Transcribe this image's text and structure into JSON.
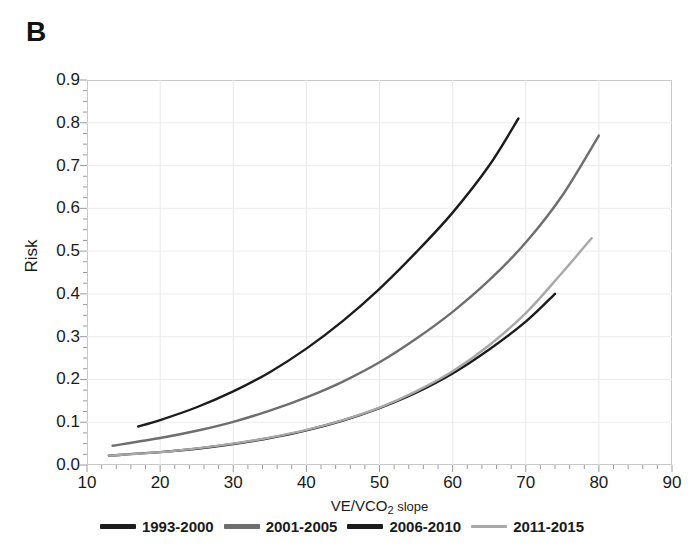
{
  "panel": {
    "label": "B"
  },
  "axes": {
    "y_label": "Risk",
    "x_label_prefix": "VE/VCO",
    "x_label_sub": "2",
    "x_label_suffix": " slope",
    "y_ticks": [
      "0.0",
      "0.1",
      "0.2",
      "0.3",
      "0.4",
      "0.5",
      "0.6",
      "0.7",
      "0.8",
      "0.9"
    ],
    "x_ticks": [
      "10",
      "20",
      "30",
      "40",
      "50",
      "60",
      "70",
      "80",
      "90"
    ]
  },
  "legend": {
    "items": [
      {
        "label": "1993-2000",
        "color": "#1c1c1c"
      },
      {
        "label": "2001-2005",
        "color": "#6e6e6e"
      },
      {
        "label": "2006-2010",
        "color": "#1c1c1c"
      },
      {
        "label": "2011-2015",
        "color": "#a8a8a8"
      }
    ]
  },
  "chart_data": {
    "type": "line",
    "title": "B",
    "xlabel": "VE/VCO2 slope",
    "ylabel": "Risk",
    "xlim": [
      10,
      90
    ],
    "ylim": [
      0.0,
      0.9
    ],
    "grid": true,
    "legend_position": "bottom",
    "series": [
      {
        "name": "1993-2000",
        "color": "#1c1c1c",
        "x": [
          17,
          20,
          25,
          30,
          35,
          40,
          45,
          50,
          55,
          60,
          65,
          69
        ],
        "y": [
          0.09,
          0.105,
          0.135,
          0.172,
          0.217,
          0.272,
          0.337,
          0.412,
          0.497,
          0.59,
          0.7,
          0.81
        ]
      },
      {
        "name": "2001-2005",
        "color": "#6e6e6e",
        "x": [
          13.5,
          20,
          25,
          30,
          35,
          40,
          45,
          50,
          55,
          60,
          65,
          70,
          75,
          80
        ],
        "y": [
          0.045,
          0.063,
          0.08,
          0.101,
          0.127,
          0.158,
          0.195,
          0.24,
          0.295,
          0.358,
          0.432,
          0.52,
          0.63,
          0.77
        ]
      },
      {
        "name": "2006-2010",
        "color": "#1c1c1c",
        "x": [
          13,
          20,
          25,
          30,
          35,
          40,
          45,
          50,
          55,
          60,
          65,
          70,
          74
        ],
        "y": [
          0.022,
          0.03,
          0.038,
          0.049,
          0.063,
          0.081,
          0.104,
          0.133,
          0.169,
          0.214,
          0.27,
          0.335,
          0.4
        ]
      },
      {
        "name": "2011-2015",
        "color": "#a8a8a8",
        "x": [
          13,
          20,
          25,
          30,
          35,
          40,
          45,
          50,
          55,
          60,
          65,
          70,
          75,
          79
        ],
        "y": [
          0.022,
          0.03,
          0.039,
          0.05,
          0.064,
          0.082,
          0.105,
          0.134,
          0.172,
          0.219,
          0.28,
          0.355,
          0.45,
          0.53
        ]
      }
    ]
  }
}
